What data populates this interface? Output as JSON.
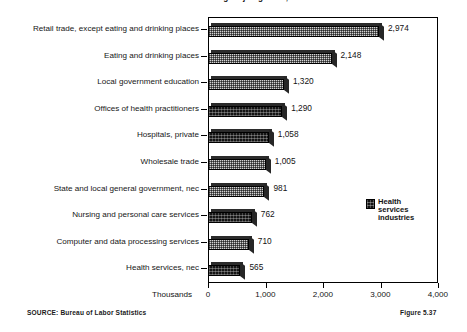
{
  "chart_data": {
    "type": "bar",
    "orientation": "horizontal",
    "title": "Industries with the largest job growth, 1990-2005",
    "categories": [
      "Retail trade, except eating and drinking places",
      "Eating and drinking places",
      "Local government education",
      "Offices of health practitioners",
      "Hospitals, private",
      "Wholesale trade",
      "State and local general government, nec",
      "Nursing and personal care services",
      "Computer and data processing services",
      "Health services, nec"
    ],
    "values": [
      2974,
      2148,
      1320,
      1290,
      1058,
      1005,
      981,
      762,
      710,
      565
    ],
    "value_labels": [
      "2,974",
      "2,148",
      "1,320",
      "1,290",
      "1,058",
      "1,005",
      "981",
      "762",
      "710",
      "565"
    ],
    "highlight_flags": [
      false,
      false,
      false,
      true,
      true,
      false,
      false,
      true,
      false,
      true
    ],
    "xlabel": "Thousands",
    "ylabel": "",
    "xlim": [
      0,
      4000
    ],
    "xticks": [
      0,
      1000,
      2000,
      3000,
      4000
    ],
    "xtick_labels": [
      "0",
      "1,000",
      "2,000",
      "3,000",
      "4,000"
    ],
    "grid": false,
    "legend": {
      "position": "inside-right",
      "entries": [
        {
          "label": "Health services industries",
          "swatch": "dark-pattern"
        }
      ]
    },
    "colors": {
      "bar_light": "#d3d3d3",
      "bar_dark": "#141414",
      "outline": "#000000",
      "text": "#121212",
      "background": "#ffffff"
    }
  },
  "legend": {
    "label": "Health services industries"
  },
  "footer": {
    "source": "SOURCE:  Bureau of Labor Statistics",
    "figure": "Figure 5.37"
  }
}
